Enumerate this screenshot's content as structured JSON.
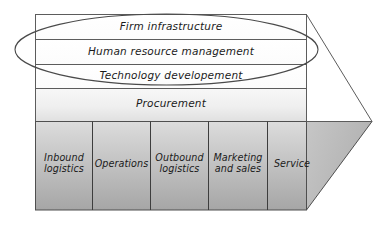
{
  "diagram": {
    "type": "porter-value-chain",
    "support_activities": [
      {
        "id": "firm-infrastructure",
        "label": "Firm infrastructure"
      },
      {
        "id": "human-resource-management",
        "label": "Human resource management"
      },
      {
        "id": "technology-developement",
        "label": "Technology developement"
      },
      {
        "id": "procurement",
        "label": "Procurement"
      }
    ],
    "primary_activities": [
      {
        "id": "inbound-logistics",
        "label": "Inbound\nlogistics"
      },
      {
        "id": "operations",
        "label": "Operations"
      },
      {
        "id": "outbound-logistics",
        "label": "Outbound\nlogistics"
      },
      {
        "id": "marketing-and-sales",
        "label": "Marketing\nand sales"
      },
      {
        "id": "service",
        "label": "Service"
      }
    ],
    "highlight": {
      "id": "ellipse-highlight",
      "shape": "ellipse",
      "covers": [
        "Firm infrastructure",
        "Human resource management",
        "Technology developement"
      ]
    },
    "colors": {
      "outline": "#595959",
      "band_fill_light": "#ffffff",
      "procurement_fill_top": "#f3f3f3",
      "procurement_fill_bottom": "#e4e4e4",
      "primary_fill_top": "#d4d4d4",
      "primary_fill_bottom": "#a9a9a9",
      "text": "#1b1b1b",
      "background": "#ffffff"
    }
  }
}
